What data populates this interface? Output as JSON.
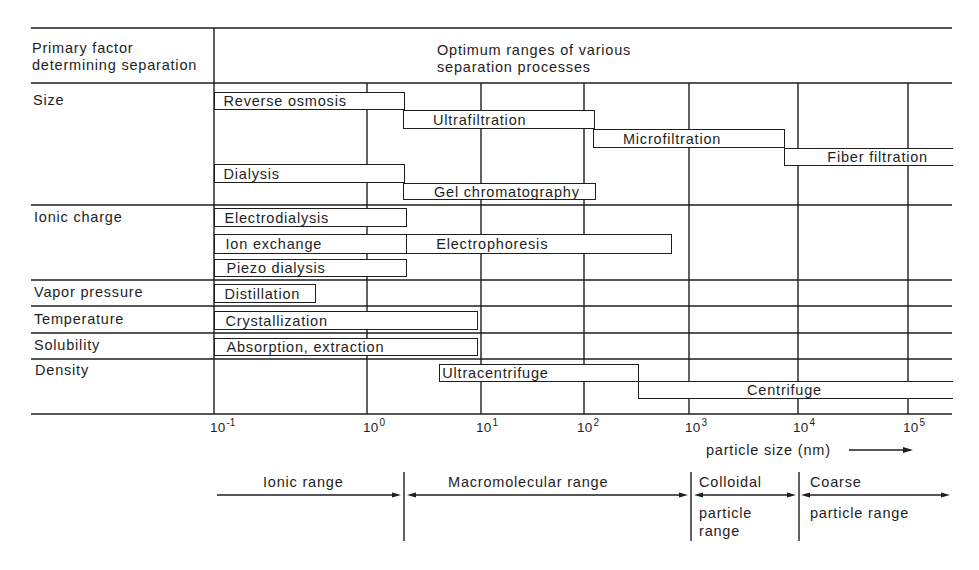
{
  "header": {
    "factor_column": [
      "Primary factor",
      "determining separation"
    ],
    "process_column": [
      "Optimum ranges of various",
      "separation processes"
    ]
  },
  "factors": [
    {
      "id": "size",
      "label": "Size"
    },
    {
      "id": "ionic_charge",
      "label": "Ionic charge"
    },
    {
      "id": "vapor_pressure",
      "label": "Vapor pressure"
    },
    {
      "id": "temperature",
      "label": "Temperature"
    },
    {
      "id": "solubility",
      "label": "Solubility"
    },
    {
      "id": "density",
      "label": "Density"
    }
  ],
  "axis": {
    "label": "particle size (nm)",
    "ticks": [
      {
        "base": "10",
        "exp": "-1"
      },
      {
        "base": "10",
        "exp": "0"
      },
      {
        "base": "10",
        "exp": "1"
      },
      {
        "base": "10",
        "exp": "2"
      },
      {
        "base": "10",
        "exp": "3"
      },
      {
        "base": "10",
        "exp": "4"
      },
      {
        "base": "10",
        "exp": "5"
      }
    ]
  },
  "size_ranges": [
    {
      "title": "Ionic range",
      "subtitle": []
    },
    {
      "title": "Macromolecular range",
      "subtitle": []
    },
    {
      "title": "Colloidal",
      "subtitle": [
        "particle",
        "range"
      ]
    },
    {
      "title": "Coarse",
      "subtitle": [
        "particle range"
      ]
    }
  ],
  "chart_data": {
    "type": "bar",
    "orientation": "horizontal-range",
    "title": "Optimum ranges of various separation processes",
    "xlabel": "particle size (nm)",
    "ylabel": "Primary factor determining separation",
    "xscale": "log10",
    "xlim": [
      0.1,
      100000
    ],
    "x_ticks": [
      0.1,
      1,
      10,
      100,
      1000,
      10000,
      100000
    ],
    "x_tick_labels": [
      "10^-1",
      "10^0",
      "10^1",
      "10^2",
      "10^3",
      "10^4",
      "10^5"
    ],
    "grid": true,
    "legend": "none",
    "categories": [
      "Reverse osmosis",
      "Ultrafiltration",
      "Microfiltration",
      "Fiber filtration",
      "Dialysis",
      "Gel chromatography",
      "Electrodialysis",
      "Ion exchange",
      "Electrophoresis",
      "Piezo dialysis",
      "Distillation",
      "Crystallization",
      "Absorption, extraction",
      "Ultracentrifuge",
      "Centrifuge"
    ],
    "processes": [
      {
        "name": "Reverse osmosis",
        "factor": "size",
        "lane": 0,
        "range_log10": [
          -1,
          0.32
        ],
        "range_nm": [
          0.1,
          2.1
        ],
        "open_ended": false
      },
      {
        "name": "Ultrafiltration",
        "factor": "size",
        "lane": 1,
        "range_log10": [
          0.32,
          2.09
        ],
        "range_nm": [
          2.1,
          123
        ],
        "open_ended": false
      },
      {
        "name": "Microfiltration",
        "factor": "size",
        "lane": 2,
        "range_log10": [
          2.09,
          3.87
        ],
        "range_nm": [
          123,
          7400
        ],
        "open_ended": false
      },
      {
        "name": "Fiber filtration",
        "factor": "size",
        "lane": 3,
        "range_log10": [
          3.87,
          5.4
        ],
        "range_nm": [
          7400,
          250000
        ],
        "open_ended": true
      },
      {
        "name": "Dialysis",
        "factor": "size",
        "lane": 4,
        "range_log10": [
          -1,
          0.32
        ],
        "range_nm": [
          0.1,
          2.1
        ],
        "open_ended": false
      },
      {
        "name": "Gel chromatography",
        "factor": "size",
        "lane": 5,
        "range_log10": [
          0.32,
          2.1
        ],
        "range_nm": [
          2.1,
          126
        ],
        "open_ended": false
      },
      {
        "name": "Electrodialysis",
        "factor": "ionic_charge",
        "lane": 0,
        "range_log10": [
          -1,
          0.34
        ],
        "range_nm": [
          0.1,
          2.2
        ],
        "open_ended": false
      },
      {
        "name": "Ion exchange",
        "factor": "ionic_charge",
        "lane": 1,
        "range_log10": [
          -1,
          0.34
        ],
        "range_nm": [
          0.1,
          2.2
        ],
        "open_ended": false
      },
      {
        "name": "Electrophoresis",
        "factor": "ionic_charge",
        "lane": 1,
        "range_log10": [
          0.34,
          2.82
        ],
        "range_nm": [
          2.2,
          660
        ],
        "open_ended": false
      },
      {
        "name": "Piezo dialysis",
        "factor": "ionic_charge",
        "lane": 2,
        "range_log10": [
          -1,
          0.34
        ],
        "range_nm": [
          0.1,
          2.2
        ],
        "open_ended": false
      },
      {
        "name": "Distillation",
        "factor": "vapor_pressure",
        "lane": 0,
        "range_log10": [
          -1,
          -0.34
        ],
        "range_nm": [
          0.1,
          0.46
        ],
        "open_ended": false
      },
      {
        "name": "Crystallization",
        "factor": "temperature",
        "lane": 0,
        "range_log10": [
          -1,
          0.96
        ],
        "range_nm": [
          0.1,
          9.1
        ],
        "open_ended": false
      },
      {
        "name": "Absorption, extraction",
        "factor": "solubility",
        "lane": 0,
        "range_log10": [
          -1,
          0.96
        ],
        "range_nm": [
          0.1,
          9.1
        ],
        "open_ended": false
      },
      {
        "name": "Ultracentrifuge",
        "factor": "density",
        "lane": 0,
        "range_log10": [
          0.63,
          2.51
        ],
        "range_nm": [
          4.3,
          320
        ],
        "open_ended": false
      },
      {
        "name": "Centrifuge",
        "factor": "density",
        "lane": 1,
        "range_log10": [
          2.51,
          5.4
        ],
        "range_nm": [
          320,
          250000
        ],
        "open_ended": true
      }
    ],
    "size_ranges": [
      {
        "name": "Ionic range",
        "range_log10": [
          -1,
          0.32
        ]
      },
      {
        "name": "Macromolecular range",
        "range_log10": [
          0.32,
          3.0
        ]
      },
      {
        "name": "Colloidal particle range",
        "range_log10": [
          3.0,
          4.0
        ]
      },
      {
        "name": "Coarse particle range",
        "range_log10": [
          4.0,
          5.4
        ]
      }
    ]
  }
}
